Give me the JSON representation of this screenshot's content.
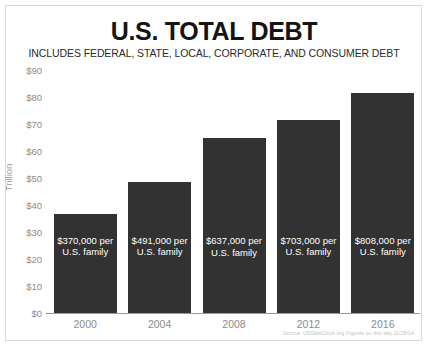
{
  "header": {
    "title": "U.S. TOTAL DEBT",
    "subtitle": "INCLUDES FEDERAL, STATE, LOCAL, CORPORATE, AND CONSUMER DEBT"
  },
  "footer": {
    "source": "Source: USDebtClock.org  Figures on this day 11/28/14"
  },
  "colors": {
    "bar": "#323232",
    "bar_text": "#ffffff",
    "axis_text": "#8c8c8c",
    "title_text": "#141414",
    "frame": "#d9d9d9",
    "background": "#ffffff"
  },
  "chart_data": {
    "type": "bar",
    "title": "U.S. TOTAL DEBT",
    "subtitle": "INCLUDES FEDERAL, STATE, LOCAL, CORPORATE, AND CONSUMER DEBT",
    "xlabel": "",
    "ylabel": "Trillion",
    "ylim": [
      0,
      90
    ],
    "ytick_values": [
      0,
      10,
      20,
      30,
      40,
      50,
      60,
      70,
      80,
      90
    ],
    "ytick_labels": [
      "$0",
      "$10",
      "$20",
      "$30",
      "$40",
      "$50",
      "$60",
      "$70",
      "$80",
      "$90"
    ],
    "grid": false,
    "legend": "none",
    "categories": [
      "2000",
      "2004",
      "2008",
      "2012",
      "2016"
    ],
    "values": [
      36.7,
      48.4,
      65.0,
      71.5,
      81.4
    ],
    "data_labels": [
      "$370,000 per\nU.S. family",
      "$491,000 per\nU.S. family",
      "$637,000 per\nU.S. family",
      "$703,000 per\nU.S. family",
      "$808,000 per\nU.S. family"
    ]
  }
}
